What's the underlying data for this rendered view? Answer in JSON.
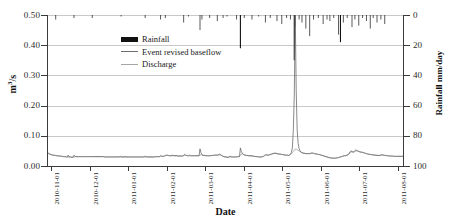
{
  "chart_data": {
    "type": "line",
    "title": "",
    "xlabel": "Date",
    "ylabel": "m3/s",
    "y2label": "Rainfall mm/day",
    "ylim": [
      0.0,
      0.5
    ],
    "y2lim": [
      100,
      0
    ],
    "y2_inverted": true,
    "grid": true,
    "legend_position": "top-left-inside",
    "yticks": [
      "0.00",
      "0.10",
      "0.20",
      "0.30",
      "0.40",
      "0.50"
    ],
    "ytick_values": [
      0.0,
      0.1,
      0.2,
      0.3,
      0.4,
      0.5
    ],
    "y2ticks": [
      "0",
      "20",
      "40",
      "60",
      "80",
      "100"
    ],
    "y2tick_values": [
      0,
      20,
      40,
      60,
      80,
      100
    ],
    "xticks": [
      "2010-11-01",
      "2010-12-01",
      "2011-01-01",
      "2011-02-01",
      "2011-03-01",
      "2011-04-01",
      "2011-05-01",
      "2011-06-01",
      "2011-07-01",
      "2011-08-01"
    ],
    "legend": [
      {
        "name": "Rainfall",
        "marker": "bar",
        "color": "#111111"
      },
      {
        "name": "Event revised baseflow",
        "marker": "line",
        "color": "#6e6e6e"
      },
      {
        "name": "Discharge",
        "marker": "line",
        "color": "#a6a6a6"
      }
    ],
    "series": [
      {
        "name": "Discharge",
        "axis": "left",
        "color": "#6b6b6b",
        "values": [
          0.044,
          0.041,
          0.039,
          0.038,
          0.037,
          0.036,
          0.036,
          0.035,
          0.035,
          0.034,
          0.034,
          0.033,
          0.033,
          0.033,
          0.032,
          0.032,
          0.031,
          0.031,
          0.031,
          0.03,
          0.03,
          0.036,
          0.03,
          0.03,
          0.029,
          0.029,
          0.029,
          0.036,
          0.032,
          0.031,
          0.031,
          0.031,
          0.031,
          0.031,
          0.031,
          0.031,
          0.031,
          0.031,
          0.031,
          0.031,
          0.031,
          0.031,
          0.031,
          0.031,
          0.031,
          0.031,
          0.031,
          0.031,
          0.031,
          0.031,
          0.031,
          0.031,
          0.031,
          0.031,
          0.031,
          0.031,
          0.031,
          0.031,
          0.031,
          0.03,
          0.03,
          0.03,
          0.03,
          0.03,
          0.03,
          0.03,
          0.03,
          0.03,
          0.03,
          0.03,
          0.03,
          0.03,
          0.03,
          0.03,
          0.03,
          0.033,
          0.03,
          0.03,
          0.03,
          0.03,
          0.031,
          0.03,
          0.03,
          0.03,
          0.03,
          0.03,
          0.03,
          0.03,
          0.03,
          0.03,
          0.03,
          0.03,
          0.03,
          0.03,
          0.03,
          0.03,
          0.03,
          0.03,
          0.03,
          0.03,
          0.03,
          0.033,
          0.031,
          0.03,
          0.03,
          0.03,
          0.03,
          0.03,
          0.03,
          0.03,
          0.03,
          0.03,
          0.031,
          0.031,
          0.031,
          0.031,
          0.031,
          0.034,
          0.033,
          0.032,
          0.032,
          0.033,
          0.035,
          0.036,
          0.036,
          0.035,
          0.034,
          0.034,
          0.034,
          0.036,
          0.035,
          0.034,
          0.034,
          0.034,
          0.034,
          0.033,
          0.033,
          0.033,
          0.033,
          0.033,
          0.033,
          0.035,
          0.039,
          0.036,
          0.035,
          0.034,
          0.034,
          0.036,
          0.034,
          0.034,
          0.034,
          0.034,
          0.034,
          0.034,
          0.034,
          0.034,
          0.034,
          0.034,
          0.057,
          0.044,
          0.038,
          0.036,
          0.035,
          0.035,
          0.034,
          0.034,
          0.034,
          0.034,
          0.034,
          0.034,
          0.035,
          0.035,
          0.035,
          0.036,
          0.036,
          0.036,
          0.036,
          0.036,
          0.04,
          0.038,
          0.036,
          0.034,
          0.032,
          0.031,
          0.03,
          0.03,
          0.029,
          0.029,
          0.029,
          0.033,
          0.031,
          0.03,
          0.03,
          0.03,
          0.03,
          0.03,
          0.03,
          0.031,
          0.031,
          0.031,
          0.06,
          0.048,
          0.042,
          0.039,
          0.037,
          0.036,
          0.035,
          0.035,
          0.034,
          0.034,
          0.034,
          0.034,
          0.033,
          0.033,
          0.032,
          0.032,
          0.031,
          0.031,
          0.031,
          0.03,
          0.03,
          0.03,
          0.03,
          0.031,
          0.032,
          0.034,
          0.038,
          0.037,
          0.036,
          0.036,
          0.037,
          0.038,
          0.039,
          0.04,
          0.041,
          0.042,
          0.043,
          0.042,
          0.041,
          0.04,
          0.04,
          0.039,
          0.039,
          0.038,
          0.038,
          0.037,
          0.037,
          0.036,
          0.036,
          0.036,
          0.035,
          0.036,
          0.04,
          0.045,
          0.06,
          0.12,
          0.235,
          0.5,
          0.25,
          0.12,
          0.075,
          0.058,
          0.05,
          0.046,
          0.044,
          0.043,
          0.042,
          0.042,
          0.041,
          0.041,
          0.041,
          0.041,
          0.041,
          0.042,
          0.043,
          0.043,
          0.042,
          0.041,
          0.04,
          0.04,
          0.039,
          0.038,
          0.038,
          0.037,
          0.036,
          0.035,
          0.034,
          0.033,
          0.032,
          0.031,
          0.03,
          0.029,
          0.028,
          0.027,
          0.027,
          0.026,
          0.026,
          0.026,
          0.026,
          0.026,
          0.027,
          0.027,
          0.028,
          0.029,
          0.03,
          0.031,
          0.032,
          0.033,
          0.034,
          0.034,
          0.035,
          0.036,
          0.038,
          0.042,
          0.047,
          0.05,
          0.048,
          0.046,
          0.047,
          0.051,
          0.053,
          0.052,
          0.05,
          0.048,
          0.047,
          0.046,
          0.046,
          0.045,
          0.044,
          0.043,
          0.042,
          0.041,
          0.04,
          0.039,
          0.039,
          0.038,
          0.038,
          0.037,
          0.037,
          0.036,
          0.036,
          0.036,
          0.035,
          0.035,
          0.035,
          0.035,
          0.036,
          0.038,
          0.037,
          0.036,
          0.035,
          0.035,
          0.034,
          0.034,
          0.034,
          0.033,
          0.033,
          0.033,
          0.033,
          0.032,
          0.032,
          0.032,
          0.032,
          0.032,
          0.032,
          0.032,
          0.032,
          0.032,
          0.032,
          0.032
        ]
      },
      {
        "name": "Event revised baseflow",
        "axis": "left",
        "color": "#9a9a9a",
        "values": [
          0.043,
          0.04,
          0.039,
          0.038,
          0.037,
          0.036,
          0.036,
          0.035,
          0.035,
          0.034,
          0.034,
          0.033,
          0.033,
          0.033,
          0.032,
          0.032,
          0.031,
          0.031,
          0.031,
          0.03,
          0.03,
          0.03,
          0.03,
          0.03,
          0.029,
          0.029,
          0.029,
          0.03,
          0.03,
          0.031,
          0.031,
          0.031,
          0.031,
          0.031,
          0.031,
          0.031,
          0.031,
          0.031,
          0.031,
          0.031,
          0.031,
          0.031,
          0.031,
          0.031,
          0.031,
          0.031,
          0.031,
          0.031,
          0.031,
          0.031,
          0.031,
          0.031,
          0.031,
          0.031,
          0.031,
          0.031,
          0.031,
          0.031,
          0.031,
          0.03,
          0.03,
          0.03,
          0.03,
          0.03,
          0.03,
          0.03,
          0.03,
          0.03,
          0.03,
          0.03,
          0.03,
          0.03,
          0.03,
          0.03,
          0.03,
          0.03,
          0.03,
          0.03,
          0.03,
          0.03,
          0.03,
          0.03,
          0.03,
          0.03,
          0.03,
          0.03,
          0.03,
          0.03,
          0.03,
          0.03,
          0.03,
          0.03,
          0.03,
          0.03,
          0.03,
          0.03,
          0.03,
          0.03,
          0.03,
          0.03,
          0.03,
          0.03,
          0.03,
          0.03,
          0.03,
          0.03,
          0.03,
          0.03,
          0.03,
          0.03,
          0.03,
          0.03,
          0.031,
          0.031,
          0.031,
          0.031,
          0.031,
          0.032,
          0.032,
          0.032,
          0.032,
          0.033,
          0.034,
          0.035,
          0.035,
          0.035,
          0.034,
          0.034,
          0.034,
          0.034,
          0.034,
          0.034,
          0.034,
          0.034,
          0.034,
          0.033,
          0.033,
          0.033,
          0.033,
          0.033,
          0.033,
          0.034,
          0.035,
          0.035,
          0.035,
          0.034,
          0.034,
          0.034,
          0.034,
          0.034,
          0.034,
          0.034,
          0.034,
          0.034,
          0.034,
          0.034,
          0.034,
          0.034,
          0.036,
          0.038,
          0.036,
          0.035,
          0.035,
          0.035,
          0.034,
          0.034,
          0.034,
          0.034,
          0.034,
          0.034,
          0.035,
          0.035,
          0.035,
          0.036,
          0.036,
          0.036,
          0.036,
          0.036,
          0.037,
          0.037,
          0.035,
          0.034,
          0.032,
          0.031,
          0.03,
          0.03,
          0.029,
          0.029,
          0.029,
          0.03,
          0.03,
          0.03,
          0.03,
          0.03,
          0.03,
          0.03,
          0.03,
          0.031,
          0.031,
          0.031,
          0.036,
          0.04,
          0.04,
          0.038,
          0.037,
          0.036,
          0.035,
          0.035,
          0.034,
          0.034,
          0.034,
          0.034,
          0.033,
          0.033,
          0.032,
          0.032,
          0.031,
          0.031,
          0.031,
          0.03,
          0.03,
          0.03,
          0.03,
          0.031,
          0.032,
          0.034,
          0.036,
          0.036,
          0.036,
          0.036,
          0.037,
          0.038,
          0.039,
          0.04,
          0.041,
          0.042,
          0.042,
          0.042,
          0.041,
          0.04,
          0.04,
          0.039,
          0.039,
          0.038,
          0.038,
          0.037,
          0.037,
          0.036,
          0.036,
          0.036,
          0.035,
          0.036,
          0.038,
          0.04,
          0.044,
          0.048,
          0.052,
          0.056,
          0.056,
          0.054,
          0.052,
          0.05,
          0.048,
          0.046,
          0.044,
          0.043,
          0.042,
          0.042,
          0.041,
          0.041,
          0.041,
          0.041,
          0.041,
          0.042,
          0.042,
          0.042,
          0.042,
          0.041,
          0.04,
          0.04,
          0.039,
          0.038,
          0.038,
          0.037,
          0.036,
          0.035,
          0.034,
          0.033,
          0.032,
          0.031,
          0.03,
          0.029,
          0.028,
          0.027,
          0.027,
          0.026,
          0.026,
          0.026,
          0.026,
          0.026,
          0.027,
          0.027,
          0.028,
          0.029,
          0.03,
          0.031,
          0.032,
          0.033,
          0.034,
          0.034,
          0.035,
          0.036,
          0.038,
          0.04,
          0.044,
          0.047,
          0.047,
          0.046,
          0.046,
          0.048,
          0.05,
          0.05,
          0.049,
          0.048,
          0.047,
          0.046,
          0.046,
          0.045,
          0.044,
          0.043,
          0.042,
          0.041,
          0.04,
          0.039,
          0.039,
          0.038,
          0.038,
          0.037,
          0.037,
          0.036,
          0.036,
          0.036,
          0.035,
          0.035,
          0.035,
          0.035,
          0.036,
          0.036,
          0.036,
          0.035,
          0.035,
          0.035,
          0.034,
          0.034,
          0.034,
          0.033,
          0.033,
          0.033,
          0.033,
          0.032,
          0.032,
          0.032,
          0.032,
          0.032,
          0.032,
          0.032,
          0.032,
          0.032,
          0.032,
          0.032
        ]
      }
    ],
    "rainfall": {
      "name": "Rainfall",
      "axis": "right",
      "color": "#111111",
      "unit": "mm/day",
      "bars": [
        {
          "i": 8,
          "v": 3
        },
        {
          "i": 27,
          "v": 2
        },
        {
          "i": 46,
          "v": 2
        },
        {
          "i": 76,
          "v": 1
        },
        {
          "i": 101,
          "v": 2
        },
        {
          "i": 117,
          "v": 3
        },
        {
          "i": 122,
          "v": 2
        },
        {
          "i": 141,
          "v": 5
        },
        {
          "i": 146,
          "v": 1
        },
        {
          "i": 158,
          "v": 10
        },
        {
          "i": 160,
          "v": 3
        },
        {
          "i": 168,
          "v": 2
        },
        {
          "i": 176,
          "v": 4
        },
        {
          "i": 182,
          "v": 2
        },
        {
          "i": 186,
          "v": 1
        },
        {
          "i": 196,
          "v": 3
        },
        {
          "i": 200,
          "v": 22
        },
        {
          "i": 204,
          "v": 2
        },
        {
          "i": 212,
          "v": 3
        },
        {
          "i": 219,
          "v": 1
        },
        {
          "i": 226,
          "v": 5
        },
        {
          "i": 231,
          "v": 2
        },
        {
          "i": 238,
          "v": 4
        },
        {
          "i": 243,
          "v": 6
        },
        {
          "i": 248,
          "v": 2
        },
        {
          "i": 252,
          "v": 3
        },
        {
          "i": 256,
          "v": 30
        },
        {
          "i": 257,
          "v": 8
        },
        {
          "i": 261,
          "v": 3
        },
        {
          "i": 264,
          "v": 5
        },
        {
          "i": 268,
          "v": 9
        },
        {
          "i": 272,
          "v": 14
        },
        {
          "i": 276,
          "v": 3
        },
        {
          "i": 281,
          "v": 2
        },
        {
          "i": 286,
          "v": 6
        },
        {
          "i": 290,
          "v": 3
        },
        {
          "i": 293,
          "v": 4
        },
        {
          "i": 297,
          "v": 2
        },
        {
          "i": 302,
          "v": 13
        },
        {
          "i": 304,
          "v": 18
        },
        {
          "i": 307,
          "v": 5
        },
        {
          "i": 311,
          "v": 2
        },
        {
          "i": 316,
          "v": 8
        },
        {
          "i": 319,
          "v": 3
        },
        {
          "i": 323,
          "v": 7
        },
        {
          "i": 327,
          "v": 2
        },
        {
          "i": 331,
          "v": 4
        },
        {
          "i": 335,
          "v": 9
        },
        {
          "i": 338,
          "v": 2
        },
        {
          "i": 342,
          "v": 5
        },
        {
          "i": 346,
          "v": 3
        },
        {
          "i": 350,
          "v": 6
        }
      ]
    }
  }
}
